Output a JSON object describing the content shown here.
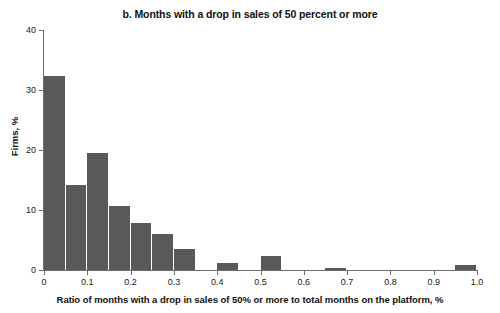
{
  "chart_data": {
    "type": "bar",
    "title": "b. Months with a drop in sales of 50 percent or more",
    "subtitle": "",
    "xlabel": "Ratio of months with a drop in sales of 50% or more to total months on the platform, %",
    "ylabel": "Firms, %",
    "xlim": [
      0,
      1.0
    ],
    "ylim": [
      0,
      40
    ],
    "grid": false,
    "legend": "none",
    "bar_color": "#595959",
    "bin_width": 0.05,
    "xticks": [
      {
        "value": 0,
        "label": "0"
      },
      {
        "value": 0.1,
        "label": "0.1"
      },
      {
        "value": 0.2,
        "label": "0.2"
      },
      {
        "value": 0.3,
        "label": "0.3"
      },
      {
        "value": 0.4,
        "label": "0.4"
      },
      {
        "value": 0.5,
        "label": "0.5"
      },
      {
        "value": 0.6,
        "label": "0.6"
      },
      {
        "value": 0.7,
        "label": "0.7"
      },
      {
        "value": 0.8,
        "label": "0.8"
      },
      {
        "value": 0.9,
        "label": "0.9"
      },
      {
        "value": 1.0,
        "label": "1.0"
      }
    ],
    "yticks": [
      {
        "value": 0,
        "label": "0"
      },
      {
        "value": 10,
        "label": "10"
      },
      {
        "value": 20,
        "label": "20"
      },
      {
        "value": 30,
        "label": "30"
      },
      {
        "value": 40,
        "label": "40"
      }
    ],
    "bins": [
      {
        "x0": 0.0,
        "x1": 0.05,
        "value": 32.3
      },
      {
        "x0": 0.05,
        "x1": 0.1,
        "value": 14.2
      },
      {
        "x0": 0.1,
        "x1": 0.15,
        "value": 19.5
      },
      {
        "x0": 0.15,
        "x1": 0.2,
        "value": 10.6
      },
      {
        "x0": 0.2,
        "x1": 0.25,
        "value": 7.8
      },
      {
        "x0": 0.25,
        "x1": 0.3,
        "value": 6.0
      },
      {
        "x0": 0.3,
        "x1": 0.35,
        "value": 3.5
      },
      {
        "x0": 0.35,
        "x1": 0.4,
        "value": 0.0
      },
      {
        "x0": 0.4,
        "x1": 0.45,
        "value": 1.1
      },
      {
        "x0": 0.45,
        "x1": 0.5,
        "value": 0.0
      },
      {
        "x0": 0.5,
        "x1": 0.55,
        "value": 2.3
      },
      {
        "x0": 0.55,
        "x1": 0.6,
        "value": 0.0
      },
      {
        "x0": 0.6,
        "x1": 0.65,
        "value": 0.0
      },
      {
        "x0": 0.65,
        "x1": 0.7,
        "value": 0.3
      },
      {
        "x0": 0.7,
        "x1": 0.75,
        "value": 0.0
      },
      {
        "x0": 0.75,
        "x1": 0.8,
        "value": 0.0
      },
      {
        "x0": 0.8,
        "x1": 0.85,
        "value": 0.0
      },
      {
        "x0": 0.85,
        "x1": 0.9,
        "value": 0.0
      },
      {
        "x0": 0.9,
        "x1": 0.95,
        "value": 0.0
      },
      {
        "x0": 0.95,
        "x1": 1.0,
        "value": 0.9
      }
    ]
  }
}
